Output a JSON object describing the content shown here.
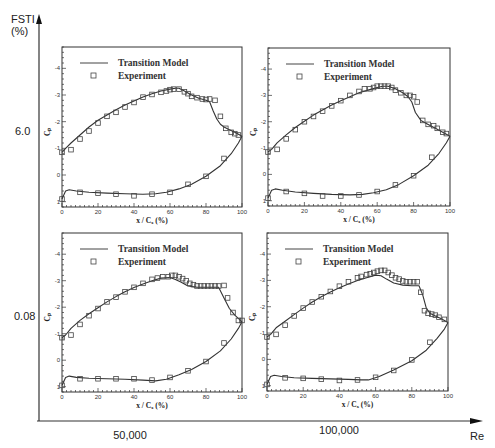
{
  "figure": {
    "y_axis_label_line1": "FSTI",
    "y_axis_label_line2": "(%)",
    "x_axis_label": "Re",
    "row_labels": [
      "6.0",
      "0.08"
    ],
    "col_labels": [
      "50,000",
      "100,000"
    ]
  },
  "chart_data": [
    {
      "type": "line",
      "panel": "top-left",
      "fsti_percent": "6.0",
      "re": "50,000",
      "xlabel": "x / C_x (%)",
      "ylabel": "C_p",
      "xlim": [
        0,
        100
      ],
      "ylim": [
        1.2,
        -4.8
      ],
      "xticks": [
        0,
        20,
        40,
        60,
        80,
        100
      ],
      "yticks": [
        -4,
        -3,
        -2,
        -1,
        0,
        1
      ],
      "legend": [
        "Transition Model",
        "Experiment"
      ],
      "series": [
        {
          "name": "Transition Model",
          "style": "line",
          "upper": {
            "x": [
              0,
              2,
              5,
              10,
              15,
              20,
              25,
              30,
              35,
              40,
              45,
              50,
              55,
              60,
              63,
              65,
              68,
              72,
              76,
              80,
              82,
              84,
              86,
              88,
              90,
              93,
              96,
              100
            ],
            "y": [
              -0.85,
              -1.0,
              -1.2,
              -1.5,
              -1.8,
              -2.05,
              -2.25,
              -2.45,
              -2.62,
              -2.78,
              -2.93,
              -3.05,
              -3.15,
              -3.22,
              -3.25,
              -3.25,
              -3.15,
              -3.0,
              -2.88,
              -2.8,
              -2.75,
              -2.4,
              -2.1,
              -1.9,
              -1.8,
              -1.7,
              -1.6,
              -1.45
            ]
          },
          "lower": {
            "x": [
              0,
              1,
              2,
              4,
              8,
              15,
              25,
              35,
              45,
              52,
              58,
              65,
              72,
              80,
              88,
              94,
              98,
              100
            ],
            "y": [
              0.9,
              0.75,
              0.6,
              0.55,
              0.6,
              0.65,
              0.68,
              0.7,
              0.72,
              0.7,
              0.65,
              0.52,
              0.35,
              0.05,
              -0.35,
              -0.8,
              -1.2,
              -1.45
            ]
          }
        },
        {
          "name": "Experiment",
          "style": "markers",
          "upper": {
            "x": [
              0,
              5,
              10,
              15,
              20,
              25,
              30,
              35,
              40,
              45,
              50,
              55,
              58,
              60,
              62,
              65,
              68,
              70,
              72,
              75,
              78,
              80,
              82,
              85,
              88,
              91,
              94,
              96,
              98
            ],
            "y": [
              -0.85,
              -0.95,
              -1.35,
              -1.65,
              -1.95,
              -2.2,
              -2.35,
              -2.55,
              -2.72,
              -2.92,
              -3.02,
              -3.1,
              -3.15,
              -3.2,
              -3.22,
              -3.22,
              -3.12,
              -3.05,
              -2.95,
              -2.9,
              -2.85,
              -2.83,
              -2.85,
              -2.8,
              -2.2,
              -1.75,
              -1.6,
              -1.55,
              -1.5
            ]
          },
          "lower": {
            "x": [
              0,
              10,
              20,
              30,
              40,
              50,
              60,
              70,
              80,
              90
            ],
            "y": [
              0.9,
              0.65,
              0.68,
              0.72,
              0.78,
              0.72,
              0.65,
              0.35,
              0.05,
              -0.62
            ]
          }
        }
      ]
    },
    {
      "type": "line",
      "panel": "top-right",
      "fsti_percent": "6.0",
      "re": "100,000",
      "xlabel": "x / C_x (%)",
      "ylabel": "C_p",
      "xlim": [
        0,
        100
      ],
      "ylim": [
        1.2,
        -4.8
      ],
      "xticks": [
        0,
        20,
        40,
        60,
        80,
        100
      ],
      "yticks": [
        -4,
        -3,
        -2,
        -1,
        0,
        1
      ],
      "legend": [
        "Transition Model",
        "Experiment"
      ],
      "series": [
        {
          "name": "Transition Model",
          "style": "line",
          "upper": {
            "x": [
              0,
              2,
              5,
              10,
              15,
              20,
              25,
              30,
              35,
              40,
              45,
              50,
              55,
              60,
              63,
              66,
              70,
              74,
              77,
              79,
              81,
              84,
              88,
              92,
              96,
              100
            ],
            "y": [
              -0.85,
              -0.95,
              -1.2,
              -1.5,
              -1.78,
              -2.02,
              -2.25,
              -2.45,
              -2.63,
              -2.8,
              -2.95,
              -3.1,
              -3.2,
              -3.3,
              -3.35,
              -3.35,
              -3.25,
              -3.1,
              -2.95,
              -2.75,
              -2.35,
              -2.05,
              -1.9,
              -1.75,
              -1.6,
              -1.45
            ]
          },
          "lower": {
            "x": [
              0,
              1,
              2,
              4,
              8,
              15,
              25,
              35,
              45,
              52,
              58,
              65,
              72,
              80,
              88,
              94,
              98,
              100
            ],
            "y": [
              0.9,
              0.75,
              0.6,
              0.55,
              0.6,
              0.67,
              0.72,
              0.76,
              0.78,
              0.76,
              0.7,
              0.58,
              0.38,
              0.05,
              -0.35,
              -0.8,
              -1.2,
              -1.45
            ]
          }
        },
        {
          "name": "Experiment",
          "style": "markers",
          "upper": {
            "x": [
              0,
              5,
              10,
              15,
              20,
              25,
              30,
              35,
              40,
              45,
              50,
              53,
              56,
              58,
              60,
              62,
              64,
              66,
              68,
              70,
              73,
              76,
              78,
              80,
              82,
              85,
              88,
              91,
              93,
              96,
              98
            ],
            "y": [
              -0.85,
              -0.95,
              -1.35,
              -1.7,
              -2.0,
              -2.2,
              -2.4,
              -2.6,
              -2.8,
              -3.0,
              -3.15,
              -3.25,
              -3.25,
              -3.3,
              -3.35,
              -3.35,
              -3.35,
              -3.35,
              -3.3,
              -3.2,
              -3.1,
              -3.0,
              -3.0,
              -2.95,
              -2.75,
              -2.05,
              -1.9,
              -1.85,
              -1.75,
              -1.6,
              -1.55
            ]
          },
          "lower": {
            "x": [
              0,
              10,
              20,
              30,
              40,
              50,
              60,
              70,
              80,
              90
            ],
            "y": [
              0.9,
              0.65,
              0.72,
              0.82,
              0.82,
              0.78,
              0.65,
              0.4,
              0.05,
              -0.65
            ]
          }
        }
      ]
    },
    {
      "type": "line",
      "panel": "bottom-left",
      "fsti_percent": "0.08",
      "re": "50,000",
      "xlabel": "x / C_x (%)",
      "ylabel": "C_p",
      "xlim": [
        0,
        100
      ],
      "ylim": [
        1.2,
        -4.8
      ],
      "xticks": [
        0,
        20,
        40,
        60,
        80,
        100
      ],
      "yticks": [
        -4,
        -3,
        -2,
        -1,
        0,
        1
      ],
      "legend": [
        "Transition Model",
        "Experiment"
      ],
      "series": [
        {
          "name": "Transition Model",
          "style": "line",
          "upper": {
            "x": [
              0,
              2,
              5,
              10,
              15,
              20,
              25,
              30,
              35,
              40,
              45,
              50,
              55,
              60,
              63,
              66,
              70,
              75,
              80,
              85,
              87,
              90,
              93,
              96,
              100
            ],
            "y": [
              -0.85,
              -0.95,
              -1.2,
              -1.5,
              -1.75,
              -1.98,
              -2.2,
              -2.4,
              -2.58,
              -2.74,
              -2.88,
              -3.0,
              -3.1,
              -3.12,
              -3.05,
              -2.95,
              -2.8,
              -2.75,
              -2.75,
              -2.75,
              -2.75,
              -2.35,
              -1.95,
              -1.7,
              -1.45
            ]
          },
          "lower": {
            "x": [
              0,
              1,
              2,
              4,
              8,
              15,
              25,
              35,
              45,
              52,
              58,
              65,
              72,
              80,
              88,
              94,
              98,
              100
            ],
            "y": [
              0.95,
              0.8,
              0.65,
              0.6,
              0.65,
              0.68,
              0.7,
              0.72,
              0.75,
              0.78,
              0.72,
              0.55,
              0.35,
              0.05,
              -0.35,
              -0.8,
              -1.2,
              -1.45
            ]
          }
        },
        {
          "name": "Experiment",
          "style": "markers",
          "upper": {
            "x": [
              0,
              5,
              10,
              15,
              20,
              25,
              30,
              35,
              40,
              45,
              50,
              53,
              56,
              59,
              61,
              63,
              65,
              67,
              69,
              71,
              73,
              75,
              77,
              79,
              81,
              83,
              85,
              87,
              90,
              92,
              95,
              98,
              100
            ],
            "y": [
              -0.85,
              -0.95,
              -1.35,
              -1.68,
              -1.95,
              -2.2,
              -2.38,
              -2.58,
              -2.75,
              -2.9,
              -3.05,
              -3.1,
              -3.15,
              -3.15,
              -3.2,
              -3.2,
              -3.15,
              -3.08,
              -3.0,
              -2.9,
              -2.85,
              -2.8,
              -2.8,
              -2.8,
              -2.8,
              -2.8,
              -2.8,
              -2.8,
              -2.82,
              -2.35,
              -1.8,
              -1.5,
              -1.5
            ]
          },
          "lower": {
            "x": [
              0,
              10,
              20,
              30,
              40,
              50,
              60,
              70,
              80,
              90
            ],
            "y": [
              0.95,
              0.7,
              0.7,
              0.7,
              0.7,
              0.75,
              0.65,
              0.4,
              0.05,
              -0.65
            ]
          }
        }
      ]
    },
    {
      "type": "line",
      "panel": "bottom-right",
      "fsti_percent": "0.08",
      "re": "100,000",
      "xlabel": "x / C_x (%)",
      "ylabel": "C_p",
      "xlim": [
        0,
        100
      ],
      "ylim": [
        1.2,
        -4.8
      ],
      "xticks": [
        0,
        20,
        40,
        60,
        80,
        100
      ],
      "yticks": [
        -4,
        -3,
        -2,
        -1,
        0,
        1
      ],
      "legend": [
        "Transition Model",
        "Experiment"
      ],
      "series": [
        {
          "name": "Transition Model",
          "style": "line",
          "upper": {
            "x": [
              0,
              2,
              5,
              10,
              15,
              20,
              25,
              30,
              35,
              40,
              45,
              50,
              55,
              60,
              63,
              66,
              70,
              75,
              80,
              84,
              86,
              88,
              90,
              93,
              96,
              100
            ],
            "y": [
              -0.85,
              -0.95,
              -1.2,
              -1.45,
              -1.7,
              -1.95,
              -2.18,
              -2.38,
              -2.56,
              -2.72,
              -2.86,
              -3.0,
              -3.1,
              -3.2,
              -3.18,
              -3.05,
              -2.9,
              -2.82,
              -2.8,
              -2.8,
              -2.45,
              -1.95,
              -1.75,
              -1.65,
              -1.55,
              -1.4
            ]
          },
          "lower": {
            "x": [
              0,
              1,
              2,
              4,
              8,
              15,
              25,
              35,
              45,
              52,
              56,
              62,
              70,
              80,
              88,
              94,
              98,
              100
            ],
            "y": [
              0.95,
              0.8,
              0.65,
              0.6,
              0.65,
              0.7,
              0.72,
              0.74,
              0.76,
              0.78,
              0.78,
              0.65,
              0.4,
              0.05,
              -0.35,
              -0.8,
              -1.15,
              -1.4
            ]
          }
        },
        {
          "name": "Experiment",
          "style": "markers",
          "upper": {
            "x": [
              0,
              5,
              10,
              15,
              20,
              25,
              30,
              35,
              40,
              45,
              50,
              52,
              55,
              57,
              59,
              61,
              63,
              65,
              67,
              69,
              71,
              73,
              75,
              77,
              79,
              81,
              83,
              85,
              87,
              89,
              91,
              93,
              95,
              98
            ],
            "y": [
              -0.85,
              -0.95,
              -1.3,
              -1.65,
              -1.95,
              -2.18,
              -2.38,
              -2.58,
              -2.78,
              -2.95,
              -3.1,
              -3.15,
              -3.22,
              -3.25,
              -3.3,
              -3.35,
              -3.38,
              -3.38,
              -3.3,
              -3.2,
              -3.1,
              -3.05,
              -2.98,
              -2.95,
              -2.95,
              -2.95,
              -2.95,
              -2.55,
              -1.85,
              -1.75,
              -1.72,
              -1.68,
              -1.6,
              -1.52
            ]
          },
          "lower": {
            "x": [
              0,
              10,
              20,
              30,
              40,
              50,
              60,
              70,
              80,
              90
            ],
            "y": [
              0.95,
              0.7,
              0.72,
              0.75,
              0.8,
              0.78,
              0.68,
              0.42,
              0.02,
              -0.65
            ]
          }
        }
      ]
    }
  ],
  "panels_layout": [
    {
      "left": 62,
      "top": 47,
      "right": 242,
      "bottom": 207
    },
    {
      "left": 268,
      "top": 48,
      "right": 450,
      "bottom": 206
    },
    {
      "left": 62,
      "top": 233,
      "right": 242,
      "bottom": 392
    },
    {
      "left": 267,
      "top": 233,
      "right": 448,
      "bottom": 391
    }
  ]
}
